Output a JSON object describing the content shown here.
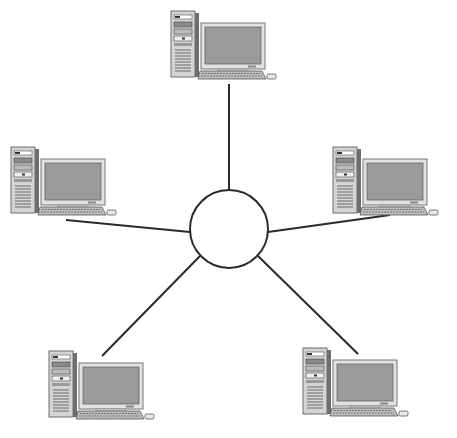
{
  "diagram": {
    "type": "star-topology",
    "colors": {
      "background": "#ffffff",
      "line": "#2a2a2a",
      "hub_fill": "#ffffff",
      "hub_stroke": "#2a2a2a",
      "case": "#d4d4d4",
      "case_dark": "#6e6e6e",
      "screen": "#9a9a9a",
      "bezel": "#e2e2e2",
      "keyboard": "#bdbdbd"
    },
    "hub": {
      "label": "central hub",
      "cx": 229,
      "cy": 229,
      "r": 39
    },
    "nodes": [
      {
        "id": "pc-top",
        "label": "computer (top)",
        "x": 170,
        "y": 10,
        "link": [
          229,
          84,
          229,
          190
        ]
      },
      {
        "id": "pc-left",
        "label": "computer (left)",
        "x": 10,
        "y": 146,
        "link": [
          66,
          220,
          190,
          232
        ]
      },
      {
        "id": "pc-right",
        "label": "computer (right)",
        "x": 332,
        "y": 146,
        "link": [
          390,
          215,
          268,
          232
        ]
      },
      {
        "id": "pc-bottom-left",
        "label": "computer (bottom-left)",
        "x": 48,
        "y": 350,
        "link": [
          102,
          356,
          200,
          256
        ]
      },
      {
        "id": "pc-bottom-right",
        "label": "computer (bottom-right)",
        "x": 302,
        "y": 347,
        "link": [
          358,
          354,
          258,
          256
        ]
      }
    ]
  }
}
